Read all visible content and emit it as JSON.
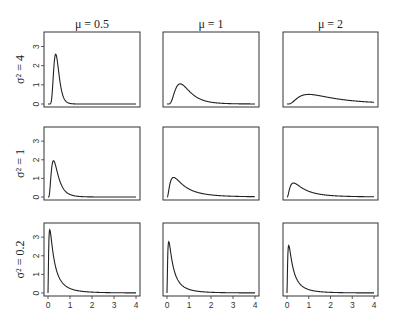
{
  "chart_data": {
    "type": "line",
    "layout": "3x3 small multiples",
    "column_titles": [
      "μ = 0.5",
      "μ = 1",
      "μ = 2"
    ],
    "row_labels": [
      "σ² = 4",
      "σ² = 1",
      "σ² = 0.2"
    ],
    "x_ticks": [
      0,
      1,
      2,
      3,
      4
    ],
    "y_ticks": [
      0,
      1,
      2,
      3
    ],
    "xlim": [
      0,
      4
    ],
    "ylim": [
      0,
      3.6
    ],
    "xlabel": "",
    "ylabel": "",
    "grid": false,
    "legend": "none",
    "panels": [
      {
        "row": 0,
        "col": 0,
        "mu": 0.5,
        "sigma2": 4,
        "peak_x": 0.35,
        "peak_y": 2.6
      },
      {
        "row": 0,
        "col": 1,
        "mu": 1,
        "sigma2": 4,
        "peak_x": 0.6,
        "peak_y": 1.05
      },
      {
        "row": 0,
        "col": 2,
        "mu": 2,
        "sigma2": 4,
        "peak_x": 1.0,
        "peak_y": 0.5
      },
      {
        "row": 1,
        "col": 0,
        "mu": 0.5,
        "sigma2": 1,
        "peak_x": 0.25,
        "peak_y": 1.95
      },
      {
        "row": 1,
        "col": 1,
        "mu": 1,
        "sigma2": 1,
        "peak_x": 0.3,
        "peak_y": 1.05
      },
      {
        "row": 1,
        "col": 2,
        "mu": 2,
        "sigma2": 1,
        "peak_x": 0.3,
        "peak_y": 0.75
      },
      {
        "row": 2,
        "col": 0,
        "mu": 0.5,
        "sigma2": 0.2,
        "peak_x": 0.08,
        "peak_y": 3.4
      },
      {
        "row": 2,
        "col": 1,
        "mu": 1,
        "sigma2": 0.2,
        "peak_x": 0.08,
        "peak_y": 2.75
      },
      {
        "row": 2,
        "col": 2,
        "mu": 2,
        "sigma2": 0.2,
        "peak_x": 0.08,
        "peak_y": 2.55
      }
    ]
  },
  "geometry": {
    "col_left": [
      44,
      163,
      283
    ],
    "col_right": [
      140,
      259,
      378
    ],
    "row_top": [
      32,
      127,
      223
    ],
    "row_bottom": [
      107,
      200,
      296
    ],
    "line_color": "#222222",
    "frame_color": "#333333"
  }
}
